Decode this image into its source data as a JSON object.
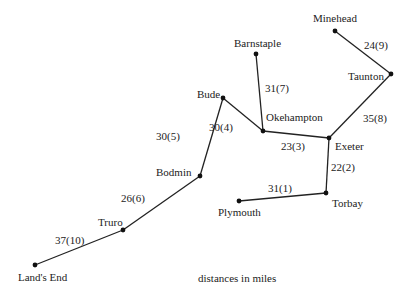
{
  "diagram": {
    "type": "weighted-network",
    "caption": "distances in miles",
    "nodes": [
      {
        "id": "minehead",
        "label": "Minehead",
        "x": 335,
        "y": 31
      },
      {
        "id": "barnstaple",
        "label": "Barnstaple",
        "x": 256,
        "y": 54
      },
      {
        "id": "taunton",
        "label": "Taunton",
        "x": 391,
        "y": 74
      },
      {
        "id": "bude",
        "label": "Bude",
        "x": 223,
        "y": 98
      },
      {
        "id": "okehampton",
        "label": "Okehampton",
        "x": 263,
        "y": 131
      },
      {
        "id": "exeter",
        "label": "Exeter",
        "x": 329,
        "y": 138
      },
      {
        "id": "bodmin",
        "label": "Bodmin",
        "x": 200,
        "y": 176
      },
      {
        "id": "torbay",
        "label": "Torbay",
        "x": 326,
        "y": 193
      },
      {
        "id": "plymouth",
        "label": "Plymouth",
        "x": 239,
        "y": 201
      },
      {
        "id": "truro",
        "label": "Truro",
        "x": 123,
        "y": 230
      },
      {
        "id": "landsend",
        "label": "Land's End",
        "x": 35,
        "y": 265
      }
    ],
    "edges": [
      {
        "from": "minehead",
        "to": "taunton",
        "label": "24(9)"
      },
      {
        "from": "taunton",
        "to": "exeter",
        "label": "35(8)"
      },
      {
        "from": "barnstaple",
        "to": "okehampton",
        "label": "31(7)"
      },
      {
        "from": "bude",
        "to": "okehampton",
        "label": "30(4)"
      },
      {
        "from": "okehampton",
        "to": "exeter",
        "label": "23(3)"
      },
      {
        "from": "exeter",
        "to": "torbay",
        "label": "22(2)"
      },
      {
        "from": "torbay",
        "to": "plymouth",
        "label": "31(1)"
      },
      {
        "from": "bude",
        "to": "bodmin",
        "label": "30(5)"
      },
      {
        "from": "bodmin",
        "to": "truro",
        "label": "26(6)"
      },
      {
        "from": "truro",
        "to": "landsend",
        "label": "37(10)"
      }
    ]
  }
}
